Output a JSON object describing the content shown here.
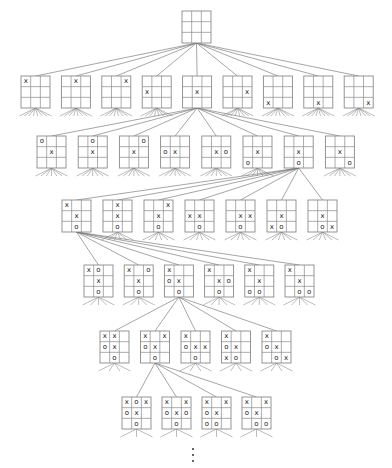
{
  "diagram": {
    "title": "",
    "type": "tic-tac-toe game tree",
    "colors": {
      "line": "#6a6a6a",
      "board": "#8a8a8a",
      "mark": "#222222",
      "background": "#ffffff"
    },
    "board_size": {
      "w": 29,
      "h": 32
    },
    "root": {
      "x": 182,
      "y": 11,
      "cells": [
        "",
        "",
        "",
        "",
        "",
        "",
        "",
        "",
        ""
      ]
    },
    "levels": [
      {
        "level": 1,
        "y": 76,
        "x_start": 21,
        "x_step": 40.4,
        "expanded_index": 4,
        "boards": [
          [
            "x",
            "",
            "",
            "",
            "",
            "",
            "",
            "",
            ""
          ],
          [
            "",
            "x",
            "",
            "",
            "",
            "",
            "",
            "",
            ""
          ],
          [
            "",
            "",
            "x",
            "",
            "",
            "",
            "",
            "",
            ""
          ],
          [
            "",
            "",
            "",
            "x",
            "",
            "",
            "",
            "",
            ""
          ],
          [
            "",
            "",
            "",
            "",
            "x",
            "",
            "",
            "",
            ""
          ],
          [
            "",
            "",
            "",
            "",
            "",
            "x",
            "",
            "",
            ""
          ],
          [
            "",
            "",
            "",
            "",
            "",
            "",
            "x",
            "",
            ""
          ],
          [
            "",
            "",
            "",
            "",
            "",
            "",
            "",
            "x",
            ""
          ],
          [
            "",
            "",
            "",
            "",
            "",
            "",
            "",
            "",
            "x"
          ]
        ]
      },
      {
        "level": 2,
        "y": 136,
        "x_start": 37,
        "x_step": 41.2,
        "expanded_index": 6,
        "boards": [
          [
            "o",
            "",
            "",
            "",
            "x",
            "",
            "",
            "",
            ""
          ],
          [
            "",
            "o",
            "",
            "",
            "x",
            "",
            "",
            "",
            ""
          ],
          [
            "",
            "",
            "o",
            "",
            "x",
            "",
            "",
            "",
            ""
          ],
          [
            "",
            "",
            "",
            "o",
            "x",
            "",
            "",
            "",
            ""
          ],
          [
            "",
            "",
            "",
            "",
            "x",
            "o",
            "",
            "",
            ""
          ],
          [
            "",
            "",
            "",
            "",
            "x",
            "",
            "o",
            "",
            ""
          ],
          [
            "",
            "",
            "",
            "",
            "x",
            "",
            "",
            "o",
            ""
          ],
          [
            "",
            "",
            "",
            "",
            "x",
            "",
            "",
            "",
            "o"
          ]
        ]
      },
      {
        "level": 3,
        "y": 200,
        "x_start": 62,
        "x_step": 41,
        "expanded_index": 0,
        "boards": [
          [
            "x",
            "",
            "",
            "",
            "x",
            "",
            "",
            "o",
            ""
          ],
          [
            "",
            "x",
            "",
            "",
            "x",
            "",
            "",
            "o",
            ""
          ],
          [
            "",
            "",
            "x",
            "",
            "x",
            "",
            "",
            "o",
            ""
          ],
          [
            "",
            "",
            "",
            "x",
            "x",
            "",
            "",
            "o",
            ""
          ],
          [
            "",
            "",
            "",
            "",
            "x",
            "x",
            "",
            "o",
            ""
          ],
          [
            "",
            "",
            "",
            "",
            "x",
            "",
            "x",
            "o",
            ""
          ],
          [
            "",
            "",
            "",
            "",
            "x",
            "",
            "",
            "o",
            "x"
          ]
        ]
      },
      {
        "level": 4,
        "y": 265,
        "x_start": 84,
        "x_step": 40.2,
        "expanded_index": 2,
        "boards": [
          [
            "x",
            "o",
            "",
            "",
            "x",
            "",
            "",
            "o",
            ""
          ],
          [
            "x",
            "",
            "o",
            "",
            "x",
            "",
            "",
            "o",
            ""
          ],
          [
            "x",
            "",
            "",
            "o",
            "x",
            "",
            "",
            "o",
            ""
          ],
          [
            "x",
            "",
            "",
            "",
            "x",
            "o",
            "",
            "o",
            ""
          ],
          [
            "x",
            "",
            "",
            "",
            "x",
            "",
            "o",
            "o",
            ""
          ],
          [
            "x",
            "",
            "",
            "",
            "x",
            "",
            "",
            "o",
            "o"
          ]
        ]
      },
      {
        "level": 5,
        "y": 331,
        "x_start": 100,
        "x_step": 40.5,
        "expanded_index": 1,
        "boards": [
          [
            "x",
            "x",
            "",
            "o",
            "x",
            "",
            "",
            "o",
            ""
          ],
          [
            "x",
            "",
            "x",
            "o",
            "x",
            "",
            "",
            "o",
            ""
          ],
          [
            "x",
            "",
            "",
            "o",
            "x",
            "x",
            "",
            "o",
            ""
          ],
          [
            "x",
            "",
            "",
            "o",
            "x",
            "",
            "x",
            "o",
            ""
          ],
          [
            "x",
            "",
            "",
            "o",
            "x",
            "",
            "",
            "o",
            "x"
          ]
        ]
      },
      {
        "level": 6,
        "y": 397,
        "x_start": 122,
        "x_step": 40,
        "expanded_index": -1,
        "boards": [
          [
            "x",
            "o",
            "x",
            "o",
            "x",
            "",
            "",
            "o",
            ""
          ],
          [
            "x",
            "",
            "x",
            "o",
            "x",
            "o",
            "",
            "o",
            ""
          ],
          [
            "x",
            "",
            "x",
            "o",
            "x",
            "",
            "o",
            "o",
            ""
          ],
          [
            "x",
            "",
            "x",
            "o",
            "x",
            "",
            "",
            "o",
            "o"
          ]
        ]
      }
    ],
    "ellipsis": {
      "x": 193,
      "y": [
        449,
        455,
        461
      ],
      "label": "⋮"
    }
  }
}
